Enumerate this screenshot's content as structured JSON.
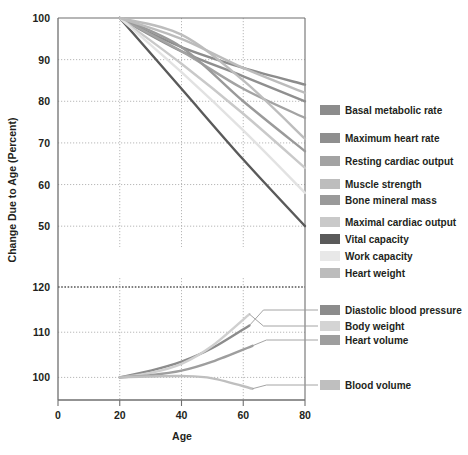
{
  "chart_data": {
    "type": "line",
    "title": "",
    "xlabel": "Age",
    "ylabel": "Change Due to Age (Percent)",
    "grid": true,
    "legend_position": "right",
    "panels": [
      {
        "name": "declining",
        "ylim": [
          45,
          100
        ],
        "yticks": [
          100,
          90,
          80,
          70,
          60,
          50
        ],
        "xlim": [
          0,
          80
        ],
        "xticks": [
          0,
          20,
          40,
          60,
          80
        ],
        "series": [
          {
            "name": "Basal metabolic rate",
            "color": "#8c8c8c",
            "x": [
              20,
              40,
              60,
              80
            ],
            "values": [
              100,
              93,
              88,
              84
            ]
          },
          {
            "name": "Maximum heart rate",
            "color": "#8f8f8f",
            "x": [
              20,
              40,
              60,
              80
            ],
            "values": [
              100,
              92,
              86,
              80
            ]
          },
          {
            "name": "Resting cardiac output",
            "color": "#a3a3a3",
            "x": [
              20,
              40,
              60,
              80
            ],
            "values": [
              100,
              92,
              83,
              76
            ]
          },
          {
            "name": "Muscle strength",
            "color": "#bdbdbd",
            "x": [
              20,
              40,
              60,
              80
            ],
            "values": [
              100,
              96,
              85,
              71
            ]
          },
          {
            "name": "Bone mineral mass",
            "color": "#9a9a9a",
            "x": [
              20,
              40,
              60,
              80
            ],
            "values": [
              100,
              93,
              80,
              68
            ]
          },
          {
            "name": "Maximal cardiac output",
            "color": "#c9c9c9",
            "x": [
              20,
              40,
              60,
              80
            ],
            "values": [
              100,
              89,
              77,
              64
            ]
          },
          {
            "name": "Vital capacity",
            "color": "#5a5a5a",
            "x": [
              20,
              40,
              60,
              80
            ],
            "values": [
              100,
              83,
              66,
              50
            ]
          },
          {
            "name": "Work capacity",
            "color": "#e2e2e2",
            "x": [
              20,
              40,
              60,
              80
            ],
            "values": [
              100,
              87,
              73,
              58
            ]
          },
          {
            "name": "Heart weight",
            "color": "#bcbcbc",
            "x": [
              20,
              40,
              60,
              80
            ],
            "values": [
              100,
              95,
              88,
              82
            ]
          }
        ]
      },
      {
        "name": "increasing",
        "ylim": [
          95,
          122
        ],
        "yticks": [
          120,
          110,
          100
        ],
        "xlim": [
          0,
          80
        ],
        "xticks": [
          0,
          20,
          40,
          60,
          80
        ],
        "series": [
          {
            "name": "Diastolic blood pressure",
            "color": "#8c8c8c",
            "x": [
              20,
              30,
              40,
              50,
              62
            ],
            "values": [
              100,
              101.5,
              103.5,
              106.5,
              111.5
            ]
          },
          {
            "name": "Body weight",
            "color": "#cfcfcf",
            "x": [
              20,
              30,
              40,
              50,
              62
            ],
            "values": [
              100,
              101,
              103,
              107,
              114
            ]
          },
          {
            "name": "Heart volume",
            "color": "#9e9e9e",
            "x": [
              20,
              30,
              40,
              50,
              63
            ],
            "values": [
              100,
              100.5,
              101.5,
              103.5,
              107
            ]
          },
          {
            "name": "Blood volume",
            "color": "#bfbfbf",
            "x": [
              20,
              30,
              40,
              50,
              63
            ],
            "values": [
              100,
              100.2,
              100.3,
              99.8,
              97.5
            ]
          }
        ]
      }
    ]
  },
  "legend": {
    "upper": [
      {
        "label": "Basal metabolic rate",
        "color": "#8c8c8c"
      },
      {
        "label": "Maximum heart rate",
        "color": "#8f8f8f"
      },
      {
        "label": "Resting cardiac output",
        "color": "#a3a3a3"
      },
      {
        "label": "Muscle strength",
        "color": "#bdbdbd"
      },
      {
        "label": "Bone mineral mass",
        "color": "#9a9a9a"
      },
      {
        "label": "Maximal cardiac output",
        "color": "#c9c9c9"
      },
      {
        "label": "Vital capacity",
        "color": "#5a5a5a"
      },
      {
        "label": "Work capacity",
        "color": "#e8e8e8"
      },
      {
        "label": "Heart weight",
        "color": "#bcbcbc"
      }
    ],
    "lower": [
      {
        "label": "Diastolic blood pressure",
        "color": "#8c8c8c"
      },
      {
        "label": "Body weight",
        "color": "#d4d4d4"
      },
      {
        "label": "Heart volume",
        "color": "#9e9e9e"
      },
      {
        "label": "Blood volume",
        "color": "#bfbfbf"
      }
    ]
  },
  "axes": {
    "y_title": "Change Due to Age (Percent)",
    "x_title": "Age",
    "x_ticks": [
      "0",
      "20",
      "40",
      "60",
      "80"
    ],
    "y_ticks_upper": [
      "100",
      "90",
      "80",
      "70",
      "60",
      "50"
    ],
    "y_ticks_lower": [
      "120",
      "110",
      "100"
    ]
  }
}
